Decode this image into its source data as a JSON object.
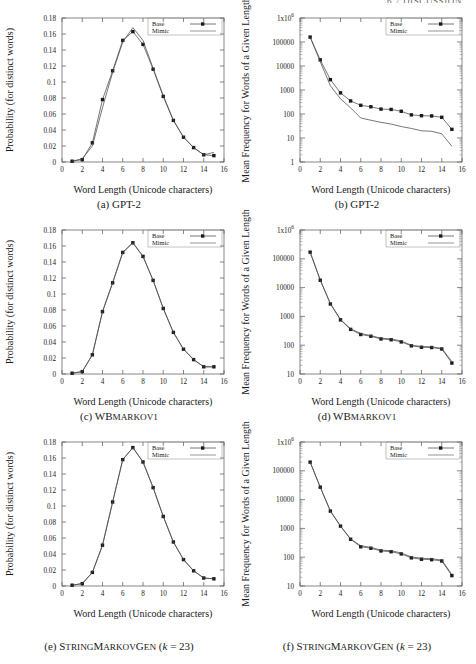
{
  "running_head": "6.7  DISCUSSION",
  "axes": {
    "xlabel": "Word Length (Unicode characters)",
    "ylabel_prob": "Probability (for distinct words)",
    "ylabel_freq": "Mean Frequency for Words of a Given Length",
    "xticks": [
      "0",
      "2",
      "4",
      "6",
      "8",
      "10",
      "12",
      "14",
      "16"
    ],
    "yticks_prob": [
      "0",
      "0.02",
      "0.04",
      "0.06",
      "0.08",
      "0.1",
      "0.12",
      "0.14",
      "0.16",
      "0.18"
    ],
    "yticks_freq_from1": [
      "1",
      "10",
      "100",
      "1000",
      "10000",
      "100000",
      "1x10"
    ],
    "yticks_freq_from10": [
      "10",
      "100",
      "1000",
      "10000",
      "100000",
      "1x10"
    ],
    "exp6": "6"
  },
  "legend": {
    "base": "Base",
    "mimic": "Mimic"
  },
  "captions": {
    "a": {
      "tag": "(a)",
      "name": "GPT-2",
      "smallcaps": "",
      "suffix": ""
    },
    "b": {
      "tag": "(b)",
      "name": "GPT-2",
      "smallcaps": "",
      "suffix": ""
    },
    "c": {
      "tag": "(c)",
      "name": "WB",
      "smallcaps": "MARKOV1",
      "suffix": ""
    },
    "d": {
      "tag": "(d)",
      "name": "WB",
      "smallcaps": "MARKOV1",
      "suffix": ""
    },
    "e": {
      "tag": "(e)",
      "name": "S",
      "smallcaps": "TRING MARKOV GEN",
      "suffix": "(k = 23)"
    },
    "f": {
      "tag": "(f)",
      "name": "S",
      "smallcaps": "TRING MARKOV GEN",
      "suffix": "(k = 23)"
    }
  },
  "caption_parts": {
    "e_small_1": "TRING",
    "e_cap_2": "M",
    "e_small_2": "ARKOV",
    "e_cap_3": "G",
    "e_small_3": "EN",
    "k_open": "(",
    "k_var": "k",
    "k_eq": " = 23)"
  },
  "chart_data": [
    {
      "id": "a",
      "type": "line",
      "title": "(a) GPT-2",
      "xlabel": "Word Length (Unicode characters)",
      "ylabel": "Probability (for distinct words)",
      "xlim": [
        0,
        16
      ],
      "ylim": [
        0,
        0.18
      ],
      "yscale": "linear",
      "grid": false,
      "legend_position": "top-right",
      "x": [
        1,
        2,
        3,
        4,
        5,
        6,
        7,
        8,
        9,
        10,
        11,
        12,
        13,
        14,
        15
      ],
      "series": [
        {
          "name": "Base",
          "marker": "filled-square",
          "values": [
            0.001,
            0.003,
            0.024,
            0.078,
            0.114,
            0.152,
            0.163,
            0.147,
            0.116,
            0.082,
            0.052,
            0.031,
            0.018,
            0.009,
            0.008
          ]
        },
        {
          "name": "Mimic",
          "marker": "none",
          "values": [
            0.001,
            0.004,
            0.02,
            0.068,
            0.112,
            0.15,
            0.168,
            0.152,
            0.117,
            0.083,
            0.052,
            0.031,
            0.018,
            0.009,
            0.012
          ]
        }
      ]
    },
    {
      "id": "b",
      "type": "line",
      "title": "(b) GPT-2",
      "xlabel": "Word Length (Unicode characters)",
      "ylabel": "Mean Frequency for Words of a Given Length",
      "xlim": [
        0,
        16
      ],
      "ylim": [
        1,
        1000000
      ],
      "yscale": "log",
      "grid": false,
      "legend_position": "top-right",
      "x": [
        1,
        2,
        3,
        4,
        5,
        6,
        7,
        8,
        9,
        10,
        11,
        12,
        13,
        14,
        15
      ],
      "series": [
        {
          "name": "Base",
          "marker": "filled-square",
          "values": [
            160000,
            18000,
            2700,
            760,
            350,
            230,
            200,
            160,
            155,
            130,
            92,
            85,
            83,
            73,
            23
          ]
        },
        {
          "name": "Mimic",
          "marker": "none",
          "values": [
            160000,
            15000,
            1500,
            430,
            180,
            68,
            55,
            45,
            38,
            30,
            25,
            20,
            19,
            15,
            4.5
          ]
        }
      ]
    },
    {
      "id": "c",
      "type": "line",
      "title": "(c) WBMarkov1",
      "xlabel": "Word Length (Unicode characters)",
      "ylabel": "Probability (for distinct words)",
      "xlim": [
        0,
        16
      ],
      "ylim": [
        0,
        0.18
      ],
      "yscale": "linear",
      "grid": false,
      "legend_position": "top-right",
      "x": [
        1,
        2,
        3,
        4,
        5,
        6,
        7,
        8,
        9,
        10,
        11,
        12,
        13,
        14,
        15
      ],
      "series": [
        {
          "name": "Base",
          "marker": "filled-square",
          "values": [
            0.001,
            0.003,
            0.024,
            0.078,
            0.114,
            0.152,
            0.164,
            0.147,
            0.117,
            0.082,
            0.052,
            0.031,
            0.018,
            0.009,
            0.009
          ]
        },
        {
          "name": "Mimic",
          "marker": "none",
          "values": [
            0.001,
            0.003,
            0.024,
            0.078,
            0.114,
            0.152,
            0.164,
            0.147,
            0.117,
            0.082,
            0.052,
            0.031,
            0.018,
            0.009,
            0.009
          ]
        }
      ]
    },
    {
      "id": "d",
      "type": "line",
      "title": "(d) WBMarkov1",
      "xlabel": "Word Length (Unicode characters)",
      "ylabel": "Mean Frequency for Words of a Given Length",
      "xlim": [
        0,
        16
      ],
      "ylim": [
        10,
        1000000
      ],
      "yscale": "log",
      "grid": false,
      "legend_position": "top-right",
      "x": [
        1,
        2,
        3,
        4,
        5,
        6,
        7,
        8,
        9,
        10,
        11,
        12,
        13,
        14,
        15
      ],
      "series": [
        {
          "name": "Base",
          "marker": "filled-square",
          "values": [
            170000,
            18000,
            2700,
            760,
            355,
            235,
            205,
            165,
            155,
            130,
            95,
            85,
            83,
            74,
            24
          ]
        },
        {
          "name": "Mimic",
          "marker": "none",
          "values": [
            170000,
            18500,
            2800,
            780,
            370,
            255,
            215,
            175,
            165,
            140,
            100,
            90,
            88,
            78,
            27
          ]
        }
      ]
    },
    {
      "id": "e",
      "type": "line",
      "title": "(e) StringMarkovGen (k = 23)",
      "xlabel": "Word Length (Unicode characters)",
      "ylabel": "Probability (for distinct words)",
      "xlim": [
        0,
        16
      ],
      "ylim": [
        0,
        0.18
      ],
      "yscale": "linear",
      "grid": false,
      "legend_position": "top-right",
      "x": [
        1,
        2,
        3,
        4,
        5,
        6,
        7,
        8,
        9,
        10,
        11,
        12,
        13,
        14,
        15
      ],
      "series": [
        {
          "name": "Base",
          "marker": "filled-square",
          "values": [
            0.001,
            0.003,
            0.017,
            0.051,
            0.105,
            0.158,
            0.173,
            0.155,
            0.123,
            0.087,
            0.055,
            0.033,
            0.019,
            0.01,
            0.009
          ]
        },
        {
          "name": "Mimic",
          "marker": "none",
          "values": [
            0.001,
            0.003,
            0.017,
            0.051,
            0.105,
            0.158,
            0.173,
            0.155,
            0.123,
            0.087,
            0.055,
            0.033,
            0.019,
            0.01,
            0.009
          ]
        }
      ]
    },
    {
      "id": "f",
      "type": "line",
      "title": "(f) StringMarkovGen (k = 23)",
      "xlabel": "Word Length (Unicode characters)",
      "ylabel": "Mean Frequency for Words of a Given Length",
      "xlim": [
        0,
        16
      ],
      "ylim": [
        10,
        1000000
      ],
      "yscale": "log",
      "grid": false,
      "legend_position": "top-right",
      "x": [
        1,
        2,
        3,
        4,
        5,
        6,
        7,
        8,
        9,
        10,
        11,
        12,
        13,
        14,
        15
      ],
      "series": [
        {
          "name": "Base",
          "marker": "filled-square",
          "values": [
            200000,
            27000,
            4000,
            1200,
            420,
            230,
            205,
            165,
            155,
            130,
            95,
            85,
            82,
            74,
            23
          ]
        },
        {
          "name": "Mimic",
          "marker": "none",
          "values": [
            200000,
            27000,
            4000,
            1200,
            430,
            250,
            220,
            175,
            168,
            140,
            102,
            92,
            88,
            80,
            25
          ]
        }
      ]
    }
  ]
}
